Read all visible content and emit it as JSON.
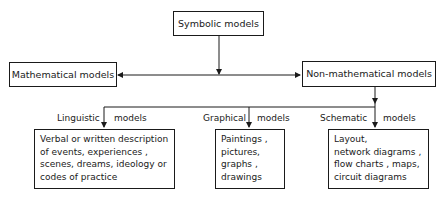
{
  "diagram": {
    "root": {
      "label": "Symbolic models"
    },
    "level1": [
      {
        "id": "mathematical",
        "label": "Mathematical models"
      },
      {
        "id": "non-mathematical",
        "label": "Non-mathematical models"
      }
    ],
    "level2": [
      {
        "id": "linguistic",
        "type_label": "Linguistic",
        "suffix_label": "models",
        "content": "Verbal or written description\nof events, experiences ,\nscenes, dreams, ideology or\ncodes of practice"
      },
      {
        "id": "graphical",
        "type_label": "Graphical",
        "suffix_label": "models",
        "content": "Paintings ,\npictures,\ngraphs ,\ndrawings"
      },
      {
        "id": "schematic",
        "type_label": "Schematic",
        "suffix_label": "models",
        "content": "Layout,\nnetwork diagrams ,\nflow charts , maps,\ncircuit diagrams"
      }
    ],
    "edges": [
      {
        "from": "Symbolic models",
        "to": "Mathematical models"
      },
      {
        "from": "Symbolic models",
        "to": "Non-mathematical models"
      },
      {
        "from": "Non-mathematical models",
        "to": "Linguistic models"
      },
      {
        "from": "Non-mathematical models",
        "to": "Graphical models"
      },
      {
        "from": "Non-mathematical models",
        "to": "Schematic models"
      }
    ]
  }
}
